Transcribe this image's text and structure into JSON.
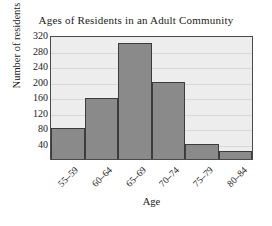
{
  "chart_data": {
    "type": "bar",
    "title": "Ages of Residents in an Adult Community",
    "xlabel": "Age",
    "ylabel": "Number of residents",
    "categories": [
      "55–59",
      "60–64",
      "65–69",
      "70–74",
      "75–79",
      "80–84"
    ],
    "values": [
      80,
      158,
      300,
      198,
      38,
      20
    ],
    "ylim": [
      0,
      320
    ],
    "yticks": [
      40,
      80,
      120,
      160,
      200,
      240,
      280,
      320
    ],
    "grid": true,
    "legend": false,
    "colors": {
      "bar_fill": "#8a8a8a",
      "bar_edge": "#3c3c3c",
      "plot_background": "#ededed",
      "gridline": "#d8d8d8",
      "axis": "#4a4a4a",
      "text": "#1a1a1a",
      "page_background": "#ffffff"
    }
  }
}
